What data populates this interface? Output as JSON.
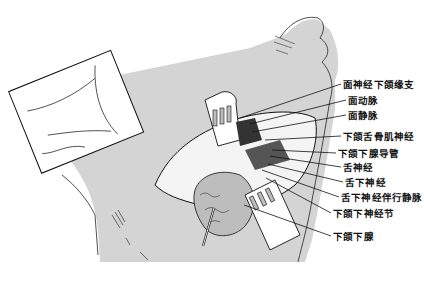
{
  "figure": {
    "colors": {
      "skin_shade": "#d4d4d4",
      "background": "#ffffff",
      "line": "#111111"
    },
    "labels": [
      {
        "id": "marginal-mandibular-branch",
        "text": "面神经下颌缘支",
        "x": 343,
        "y": 79
      },
      {
        "id": "facial-artery",
        "text": "面动脉",
        "x": 348,
        "y": 95
      },
      {
        "id": "facial-vein",
        "text": "面静脉",
        "x": 348,
        "y": 110
      },
      {
        "id": "nerve-to-mylohyoid",
        "text": "下颌舌骨肌神经",
        "x": 343,
        "y": 131
      },
      {
        "id": "submandibular-duct",
        "text": "下颌下腺导管",
        "x": 338,
        "y": 148
      },
      {
        "id": "lingual-nerve",
        "text": "舌神经",
        "x": 343,
        "y": 162
      },
      {
        "id": "hypoglossal-nerve",
        "text": "舌下神经",
        "x": 345,
        "y": 177
      },
      {
        "id": "hypoglossal-vena-comitans",
        "text": "舌下神经伴行静脉",
        "x": 341,
        "y": 192
      },
      {
        "id": "submandibular-ganglion",
        "text": "下颌下神经节",
        "x": 333,
        "y": 208
      },
      {
        "id": "submandibular-gland",
        "text": "下颌下腺",
        "x": 333,
        "y": 231
      }
    ]
  }
}
